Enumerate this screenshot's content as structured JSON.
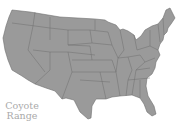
{
  "map": {
    "title": "Coyote Range",
    "label_line1": "Coyote",
    "label_line2": "Range",
    "fill_color": "#9a9a9a",
    "border_color": "#6e6e6e",
    "label_color": "#a9a9a9",
    "region": "United States (contiguous)",
    "coverage": "all states"
  }
}
